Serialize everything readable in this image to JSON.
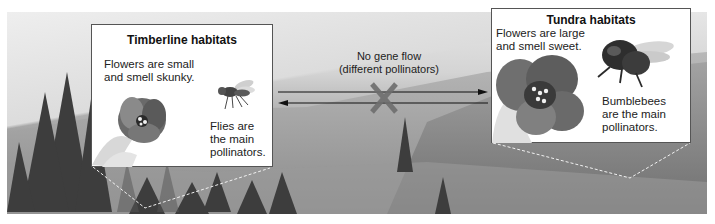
{
  "figure": {
    "colors": {
      "panel_bg": "#ffffff",
      "panel_border": "#555555",
      "text": "#222222",
      "x_mark": "#6e6e6e",
      "arrow": "#111111",
      "dashed_line": "#f2f2f2"
    }
  },
  "left_panel": {
    "title": "Timberline habitats",
    "flower_text": "Flowers are small and smell skunky.",
    "flower_lines": [
      "Flowers are small",
      "and smell skunky."
    ],
    "pollinator_lines": [
      "Flies are",
      "the main",
      "pollinators."
    ],
    "pollinator_text": "Flies are the main pollinators.",
    "flower_icon": "small-flower-icon",
    "pollinator_icon": "fly-icon"
  },
  "right_panel": {
    "title": "Tundra habitats",
    "flower_lines": [
      "Flowers are large",
      "and smell sweet."
    ],
    "flower_text": "Flowers are large and smell sweet.",
    "pollinator_lines": [
      "Bumblebees",
      "are the main",
      "pollinators."
    ],
    "pollinator_text": "Bumblebees are the main pollinators.",
    "flower_icon": "large-flower-icon",
    "pollinator_icon": "bumblebee-icon"
  },
  "center": {
    "label_line1": "No gene flow",
    "label_line2": "(different pollinators)",
    "arrow_right": "arrow-right-icon",
    "arrow_left": "arrow-left-icon",
    "blocked_mark": "x-mark-icon"
  }
}
